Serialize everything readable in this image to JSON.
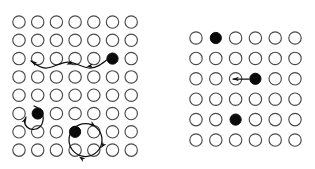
{
  "figure": {
    "width": 315,
    "height": 169,
    "background": "#ffffff",
    "site_empty_color": "#ffffff",
    "site_empty_stroke": "#4a4a4a",
    "site_filled_color": "#0a0a0a",
    "arrow_color": "#101010",
    "site_radius": 6.2,
    "filled_radius": 5.6
  },
  "panels": [
    {
      "id": "left-panel",
      "name": "left-lattice-panel",
      "rows": 8,
      "cols": 7,
      "origin_x": 19,
      "origin_y": 22,
      "dx": 18.7,
      "dy": 18.3,
      "filled_sites": [
        {
          "row": 3,
          "col": 6
        },
        {
          "row": 6,
          "col": 2
        },
        {
          "row": 7,
          "col": 4
        }
      ],
      "arrows": [
        {
          "name": "long-left-hop-arrow",
          "kind": "wavy-left",
          "path": "M 112 56 C 104 62 98 68 90 68 C 82 68 76 62 68 62 C 60 62 54 68 46 68 C 40 68 36 65 31 61",
          "heads": [
            {
              "x": 31.5,
              "y": 60.5,
              "angle": 221
            },
            {
              "x": 66.5,
              "y": 64.5,
              "angle": 160
            },
            {
              "x": 86.5,
              "y": 66.5,
              "angle": 172
            }
          ]
        },
        {
          "name": "small-vertical-loop-arrow",
          "kind": "small-loop",
          "path": "M 34 106 C 42 109 45 117 42 124 C 39 130 31 131 27 127 C 24 124 24 120 26 117",
          "heads": [
            {
              "x": 26.5,
              "y": 117.5,
              "angle": 300
            }
          ]
        },
        {
          "name": "circular-loop-arrow",
          "kind": "ring",
          "cx": 85.5,
          "cy": 140,
          "r": 16.5,
          "heads": [
            {
              "x": 95.5,
              "y": 126.5,
              "angle": 35
            },
            {
              "x": 101,
              "y": 148,
              "angle": 125
            },
            {
              "x": 79,
              "y": 156.5,
              "angle": 215
            }
          ]
        }
      ]
    },
    {
      "id": "right-panel",
      "name": "right-lattice-panel",
      "rows": 6,
      "cols": 6,
      "origin_x": 196,
      "origin_y": 38,
      "dx": 19.8,
      "dy": 20.4,
      "filled_sites": [
        {
          "row": 1,
          "col": 2
        },
        {
          "row": 3,
          "col": 4
        },
        {
          "row": 5,
          "col": 3
        }
      ],
      "arrows": [
        {
          "name": "short-left-hop-arrow",
          "kind": "straight-left",
          "path": "M 249 79 L 233 79",
          "heads": [
            {
              "x": 232.5,
              "y": 79,
              "angle": 180
            }
          ]
        }
      ]
    }
  ],
  "legend": {
    "empty_site_label": "empty site",
    "filled_site_label": "occupied site",
    "arrow_label": "hopping path"
  }
}
